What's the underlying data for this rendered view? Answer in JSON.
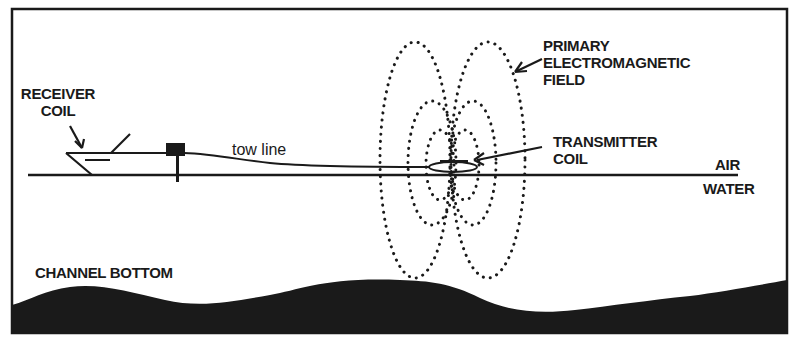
{
  "diagram": {
    "labels": {
      "receiver_coil_line1": "RECEIVER",
      "receiver_coil_line2": "COIL",
      "tow_line": "tow line",
      "primary_field_line1": "PRIMARY",
      "primary_field_line2": "ELECTROMAGNETIC",
      "primary_field_line3": "FIELD",
      "transmitter_coil_line1": "TRANSMITTER",
      "transmitter_coil_line2": "COIL",
      "air": "AIR",
      "water": "WATER",
      "channel_bottom": "CHANNEL BOTTOM"
    },
    "colors": {
      "ink": "#1a1a1a",
      "background": "#ffffff"
    }
  }
}
